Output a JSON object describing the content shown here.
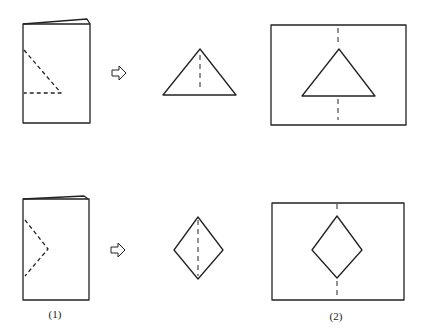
{
  "figure": {
    "rows": [
      {
        "name": "triangle-row",
        "cut_shape": "triangle"
      },
      {
        "name": "diamond-row",
        "cut_shape": "diamond"
      }
    ],
    "labels": {
      "step1": "(1)",
      "step2": "(2)"
    },
    "icons": {
      "arrow": "right-arrow-icon"
    },
    "colors": {
      "line": "#222222",
      "background": "#ffffff"
    }
  }
}
